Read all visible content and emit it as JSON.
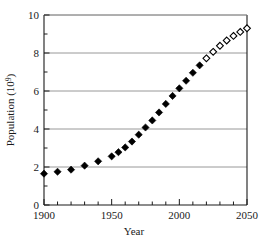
{
  "chart_data": {
    "type": "scatter",
    "title": "",
    "xlabel": "Year",
    "ylabel": "Population (10^9)",
    "ylabel_base": "Population (10",
    "ylabel_exponent": "9",
    "ylabel_close": ")",
    "xlim": [
      1900,
      2050
    ],
    "ylim": [
      0,
      10
    ],
    "grid": "horizontal-major-only",
    "legend": "none",
    "x_ticks_major": [
      1900,
      1950,
      2000,
      2050
    ],
    "x_tick_labels": [
      "1900",
      "1950",
      "2000",
      "2050"
    ],
    "x_minor_tick_interval": 10,
    "y_ticks_major": [
      0,
      2,
      4,
      6,
      8,
      10
    ],
    "y_tick_labels": [
      "0",
      "2",
      "4",
      "6",
      "8",
      "10"
    ],
    "y_minor_ticks": [
      1,
      3,
      5,
      7,
      9
    ],
    "colors": {
      "axis": "#1a1a1a",
      "grid": "#8c8c8c",
      "marker_filled": "#000000",
      "marker_open_stroke": "#000000",
      "marker_open_fill": "#ffffff",
      "background": "#ffffff"
    },
    "series": [
      {
        "name": "Historical population",
        "marker": "filled-diamond",
        "points": [
          {
            "x": 1900,
            "y": 1.65
          },
          {
            "x": 1910,
            "y": 1.75
          },
          {
            "x": 1920,
            "y": 1.86
          },
          {
            "x": 1930,
            "y": 2.07
          },
          {
            "x": 1940,
            "y": 2.3
          },
          {
            "x": 1950,
            "y": 2.56
          },
          {
            "x": 1955,
            "y": 2.78
          },
          {
            "x": 1960,
            "y": 3.03
          },
          {
            "x": 1965,
            "y": 3.34
          },
          {
            "x": 1970,
            "y": 3.7
          },
          {
            "x": 1975,
            "y": 4.08
          },
          {
            "x": 1980,
            "y": 4.45
          },
          {
            "x": 1985,
            "y": 4.87
          },
          {
            "x": 1990,
            "y": 5.32
          },
          {
            "x": 1995,
            "y": 5.74
          },
          {
            "x": 2000,
            "y": 6.14
          },
          {
            "x": 2005,
            "y": 6.54
          },
          {
            "x": 2010,
            "y": 6.96
          },
          {
            "x": 2015,
            "y": 7.35
          }
        ]
      },
      {
        "name": "Projected population",
        "marker": "open-diamond",
        "points": [
          {
            "x": 2020,
            "y": 7.72
          },
          {
            "x": 2025,
            "y": 8.06
          },
          {
            "x": 2030,
            "y": 8.38
          },
          {
            "x": 2035,
            "y": 8.66
          },
          {
            "x": 2040,
            "y": 8.9
          },
          {
            "x": 2045,
            "y": 9.11
          },
          {
            "x": 2050,
            "y": 9.3
          }
        ]
      }
    ]
  }
}
